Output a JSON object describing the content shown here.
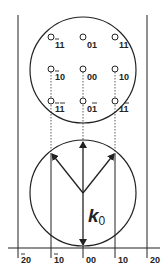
{
  "diagram": {
    "type": "ewald-sphere-construction",
    "colors": {
      "stroke": "#222222",
      "background": "#ffffff"
    },
    "reciprocal_lattice_circle": {
      "spots": [
        {
          "row": 0,
          "col": 0,
          "label": "11",
          "bar": "first"
        },
        {
          "row": 0,
          "col": 1,
          "label": "01",
          "bar": "none"
        },
        {
          "row": 0,
          "col": 2,
          "label": "11",
          "bar": "none"
        },
        {
          "row": 1,
          "col": 0,
          "label": "10",
          "bar": "first"
        },
        {
          "row": 1,
          "col": 1,
          "label": "00",
          "bar": "none"
        },
        {
          "row": 1,
          "col": 2,
          "label": "10",
          "bar": "none"
        },
        {
          "row": 2,
          "col": 0,
          "label": "11",
          "bar": "both"
        },
        {
          "row": 2,
          "col": 1,
          "label": "01",
          "bar": "second"
        },
        {
          "row": 2,
          "col": 2,
          "label": "11",
          "bar": "second"
        }
      ]
    },
    "ewald_circle": {
      "wavevector_label": "k",
      "wavevector_subscript": "0"
    },
    "axis": {
      "ticks": [
        {
          "label": "20",
          "bar": true
        },
        {
          "label": "10",
          "bar": true
        },
        {
          "label": "00",
          "bar": false
        },
        {
          "label": "10",
          "bar": false
        },
        {
          "label": "20",
          "bar": false
        }
      ]
    }
  }
}
